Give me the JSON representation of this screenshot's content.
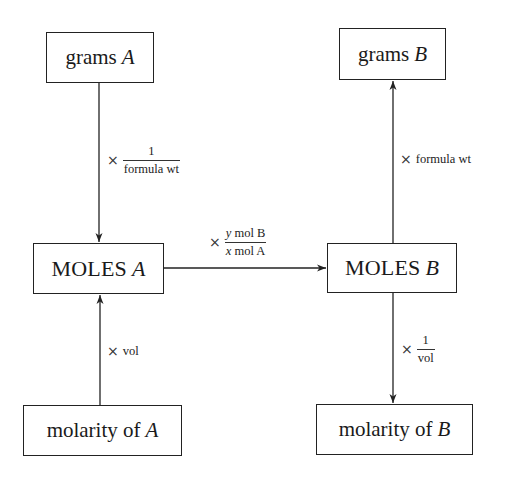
{
  "diagram": {
    "title": "",
    "nodes": {
      "grams_a": {
        "text": "grams",
        "var": "A"
      },
      "grams_b": {
        "text": "grams",
        "var": "B"
      },
      "moles_a": {
        "text": "MOLES",
        "var": "A"
      },
      "moles_b": {
        "text": "MOLES",
        "var": "B"
      },
      "molarity_a": {
        "text": "molarity of",
        "var": "A"
      },
      "molarity_b": {
        "text": "molarity of",
        "var": "B"
      }
    },
    "edges": {
      "grams_a_to_moles_a": {
        "from": "grams A",
        "to": "MOLES A",
        "operator": "×",
        "numerator": "1",
        "denominator": "formula wt"
      },
      "moles_b_to_grams_b": {
        "from": "MOLES B",
        "to": "grams B",
        "operator": "×",
        "factor": "formula wt"
      },
      "molarity_a_to_moles_a": {
        "from": "molarity of A",
        "to": "MOLES A",
        "operator": "×",
        "factor": "vol"
      },
      "moles_b_to_molarity_b": {
        "from": "MOLES B",
        "to": "molarity of B",
        "operator": "×",
        "numerator": "1",
        "denominator": "vol"
      },
      "moles_a_to_moles_b": {
        "from": "MOLES A",
        "to": "MOLES B",
        "operator": "×",
        "numerator_coef": "y",
        "numerator_unit": "mol B",
        "denominator_coef": "x",
        "denominator_unit": "mol A"
      }
    }
  }
}
